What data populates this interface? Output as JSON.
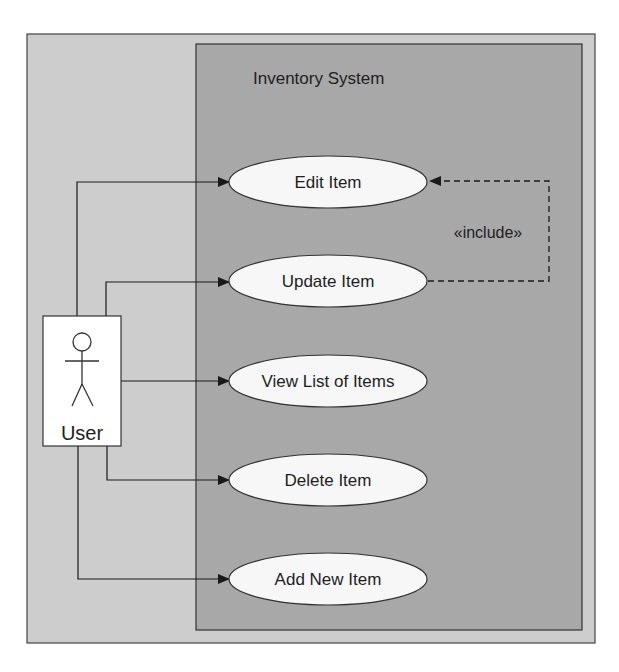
{
  "diagram": {
    "type": "uml-use-case",
    "colors": {
      "background": "#ffffff",
      "outer_frame": "#cdcdcd",
      "system_boundary": "#a8a8a8",
      "use_case_fill": "#f7f7f7",
      "actor_fill": "#ffffff",
      "stroke": "#222222"
    },
    "system": {
      "title": "Inventory System"
    },
    "actor": {
      "label": "User",
      "icon": "stick-figure-icon"
    },
    "use_cases": [
      {
        "id": "edit",
        "label": "Edit Item"
      },
      {
        "id": "update",
        "label": "Update Item"
      },
      {
        "id": "view",
        "label": "View List of Items"
      },
      {
        "id": "delete",
        "label": "Delete Item"
      },
      {
        "id": "add",
        "label": "Add New Item"
      }
    ],
    "relationships": [
      {
        "from": "User",
        "to": "Edit Item",
        "kind": "association"
      },
      {
        "from": "User",
        "to": "Update Item",
        "kind": "association"
      },
      {
        "from": "User",
        "to": "View List of Items",
        "kind": "association"
      },
      {
        "from": "User",
        "to": "Delete Item",
        "kind": "association"
      },
      {
        "from": "User",
        "to": "Add New Item",
        "kind": "association"
      },
      {
        "from": "Update Item",
        "to": "Edit Item",
        "kind": "include",
        "label": "«include»"
      }
    ]
  }
}
